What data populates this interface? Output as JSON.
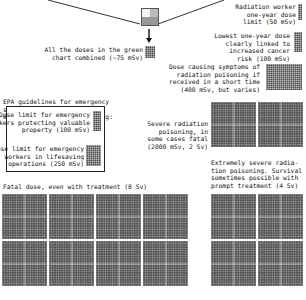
{
  "figure": {
    "zoom_indicator": {
      "label": "green chart zoom box"
    },
    "items": [
      {
        "id": "radiation_worker",
        "label": "Radiation worker\none-year dose\nlimit (50 mSv)",
        "dose_msv": 50
      },
      {
        "id": "green_combined",
        "label": "All the doses in the green\nchart combined (~75 mSv)",
        "dose_msv": 75
      },
      {
        "id": "lowest_cancer",
        "label": "Lowest one-year dose\nclearly linked to\nincreased cancer\nrisk (100 mSv)",
        "dose_msv": 100
      },
      {
        "id": "poisoning_symptoms",
        "label": "Dose causing symptoms of\nradiation poisoning if\nreceived in a short time\n(400 mSv, but varies)",
        "dose_msv": 400
      },
      {
        "id": "severe_poisoning",
        "label": "Severe radiation\npoisoning, in\nsome cases fatal\n(2000 mSv, 2 Sv)",
        "dose_msv": 2000
      },
      {
        "id": "extremely_severe",
        "label": "Extremely severe radia-\ntion poisoning. Survival\nsometimes possible with\nprompt treatment (4 Sv)",
        "dose_msv": 4000
      },
      {
        "id": "fatal_dose",
        "label": "Fatal dose, even with treatment (8 Sv)",
        "dose_msv": 8000
      }
    ],
    "epa": {
      "heading": "EPA guidelines for emergency\nsituations, provided to\nensure quick decision-making:",
      "items": [
        {
          "id": "epa_property",
          "label": "Dose limit for emergency\nworkers protecting valuable\nproperty (100 mSv)",
          "dose_msv": 100
        },
        {
          "id": "epa_lifesaving",
          "label": "Dose limit for emergency\nworkers in lifesaving\noperations (250 mSv)",
          "dose_msv": 250
        }
      ]
    },
    "colors": {
      "block_fill": "#4a4a4a",
      "background": "#ffffff",
      "text": "#111111"
    }
  }
}
